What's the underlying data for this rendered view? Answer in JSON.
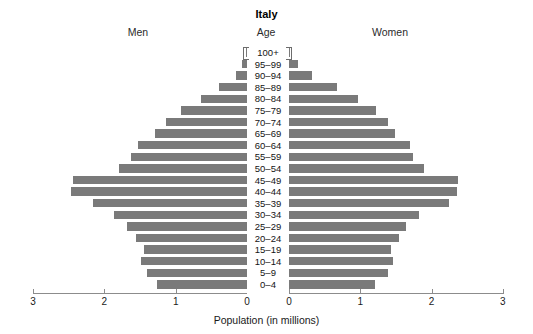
{
  "chart_data": {
    "type": "bar",
    "subtype": "population-pyramid",
    "title": "Italy",
    "center_header": "Age",
    "left_header": "Men",
    "right_header": "Women",
    "xlabel": "Population (in millions)",
    "ylabel": "",
    "grid": false,
    "legend": "none",
    "bar_color": "#7a7a7a",
    "axis_color": "#8c8c8c",
    "xlim_left": [
      3,
      0
    ],
    "xlim_right": [
      0,
      3
    ],
    "xticks_left": [
      "3",
      "2",
      "1",
      "0"
    ],
    "xticks_right": [
      "0",
      "1",
      "2",
      "3"
    ],
    "xtick_values": [
      3,
      2,
      1,
      0
    ],
    "units": "millions",
    "categories": [
      "100+",
      "95–99",
      "90–94",
      "85–89",
      "80–84",
      "75–79",
      "70–74",
      "65–69",
      "60–64",
      "55–59",
      "50–54",
      "45–49",
      "40–44",
      "35–39",
      "30–34",
      "25–29",
      "20–24",
      "15–19",
      "10–14",
      "5–9",
      "0–4"
    ],
    "series": [
      {
        "name": "Men",
        "side": "left",
        "values": [
          0.01,
          0.07,
          0.16,
          0.39,
          0.64,
          0.92,
          1.14,
          1.29,
          1.53,
          1.62,
          1.79,
          2.44,
          2.47,
          2.16,
          1.86,
          1.68,
          1.55,
          1.44,
          1.49,
          1.4,
          1.26
        ]
      },
      {
        "name": "Women",
        "side": "right",
        "values": [
          0.02,
          0.12,
          0.32,
          0.67,
          0.97,
          1.22,
          1.39,
          1.48,
          1.7,
          1.74,
          1.9,
          2.37,
          2.36,
          2.24,
          1.83,
          1.64,
          1.54,
          1.43,
          1.46,
          1.39,
          1.2
        ]
      }
    ]
  },
  "geometry": {
    "left_zero_x": 247,
    "right_zero_x": 289,
    "px_per_million": 71.3,
    "row_height": 11.6,
    "first_row_top": 47
  }
}
